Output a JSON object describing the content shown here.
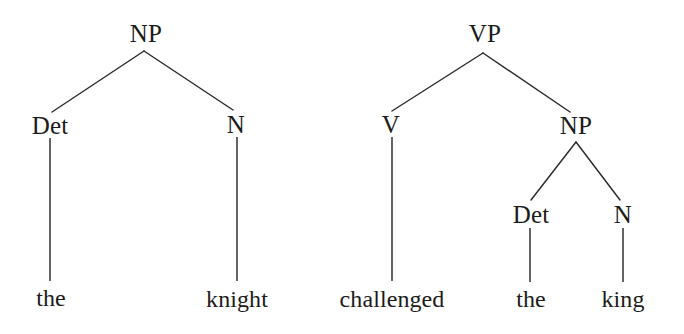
{
  "figure": {
    "kind": "syntax-tree-diagram",
    "background_color": "#ffffff",
    "ink_color": "#1b1b1b",
    "line_color": "#2a2a2a"
  },
  "trees": [
    {
      "id": "np-tree",
      "root_label": "NP",
      "nodes": {
        "root": {
          "label": "NP",
          "x": 146,
          "y": 33
        },
        "left": {
          "label": "Det",
          "x": 50,
          "y": 125
        },
        "right": {
          "label": "N",
          "x": 236,
          "y": 124
        }
      },
      "leaves": {
        "left": {
          "label": "the",
          "x": 51,
          "y": 298
        },
        "right": {
          "label": "knight",
          "x": 237,
          "y": 299
        }
      }
    },
    {
      "id": "vp-tree",
      "root_label": "VP",
      "nodes": {
        "root": {
          "label": "VP",
          "x": 485,
          "y": 33
        },
        "left": {
          "label": "V",
          "x": 391,
          "y": 124
        },
        "right": {
          "label": "NP",
          "x": 576,
          "y": 125
        },
        "right_left": {
          "label": "Det",
          "x": 531,
          "y": 214
        },
        "right_right": {
          "label": "N",
          "x": 623,
          "y": 214
        }
      },
      "leaves": {
        "v": {
          "label": "challenged",
          "x": 392,
          "y": 299
        },
        "det": {
          "label": "the",
          "x": 531,
          "y": 299
        },
        "n": {
          "label": "king",
          "x": 623,
          "y": 299
        }
      }
    }
  ],
  "phrases": {
    "left_tree_text": "the knight",
    "right_tree_text": "challenged the king"
  }
}
